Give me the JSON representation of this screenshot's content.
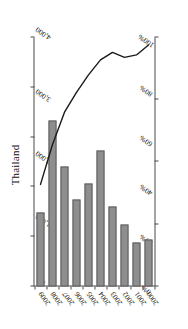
{
  "chart_data": {
    "type": "bar",
    "title": "Thailand",
    "orientation": "horizontal",
    "categories": [
      "2000",
      "2001",
      "2002",
      "2003",
      "2004",
      "2005",
      "2006",
      "2007",
      "2008",
      "2009"
    ],
    "series": [
      {
        "name": "value",
        "type": "bar",
        "axis": "value",
        "values": [
          760,
          700,
          1000,
          1290,
          2180,
          1650,
          1400,
          1920,
          2660,
          1190
        ]
      },
      {
        "name": "percent",
        "type": "line",
        "axis": "percent",
        "values": [
          97,
          93,
          92,
          94,
          91,
          85,
          78,
          70,
          57,
          41
        ]
      }
    ],
    "value_axis": {
      "label": "",
      "ticks": [
        "0",
        "1,000",
        "2,000",
        "3,000",
        "4,000"
      ],
      "tick_values": [
        0,
        1000,
        2000,
        3000,
        4000
      ],
      "lim": [
        0,
        4000
      ]
    },
    "percent_axis": {
      "label": "",
      "ticks": [
        "0%",
        "20%",
        "40%",
        "60%",
        "80%",
        "100%"
      ],
      "tick_values": [
        0,
        20,
        40,
        60,
        80,
        100
      ],
      "lim": [
        0,
        100
      ]
    },
    "xlabel": "",
    "ylabel": "",
    "grid": false,
    "legend": "none",
    "colors": {
      "bar_fill": "#8e8e8e",
      "bar_edge": "#5d5d5d",
      "line": "#1a1a1a",
      "axis": "#4a4a4a",
      "text": "#111111",
      "background": "#ffffff"
    }
  }
}
